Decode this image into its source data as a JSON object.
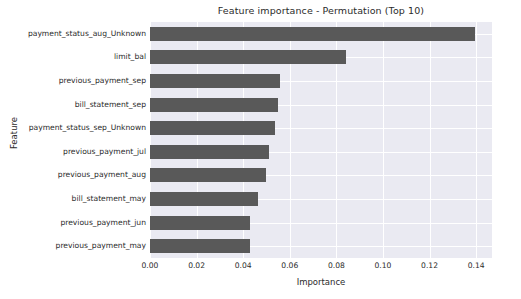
{
  "chart_data": {
    "type": "bar",
    "orientation": "horizontal",
    "title": "Feature importance - Permutation (Top 10)",
    "xlabel": "Importance",
    "ylabel": "Feature",
    "categories": [
      "payment_status_aug_Unknown",
      "limit_bal",
      "previous_payment_sep",
      "bill_statement_sep",
      "payment_status_sep_Unknown",
      "previous_payment_jul",
      "previous_payment_aug",
      "bill_statement_may",
      "previous_payment_jun",
      "previous_payment_may"
    ],
    "values": [
      0.1395,
      0.0841,
      0.056,
      0.0549,
      0.0538,
      0.0512,
      0.05,
      0.0464,
      0.0428,
      0.0428
    ],
    "xlim": [
      0.0,
      0.1468
    ],
    "ylim": [
      0,
      10
    ],
    "xticks": [
      0.0,
      0.02,
      0.04,
      0.06,
      0.08,
      0.1,
      0.12,
      0.14
    ],
    "xtick_labels": [
      "0.00",
      "0.02",
      "0.04",
      "0.06",
      "0.08",
      "0.10",
      "0.12",
      "0.14"
    ],
    "grid": true,
    "grid_color": "#ffffff",
    "legend": null,
    "bar_color": "#595959",
    "plot_background": "#eaeaf2",
    "figure_background": "#ffffff",
    "text_color": "#2b2b2b"
  }
}
